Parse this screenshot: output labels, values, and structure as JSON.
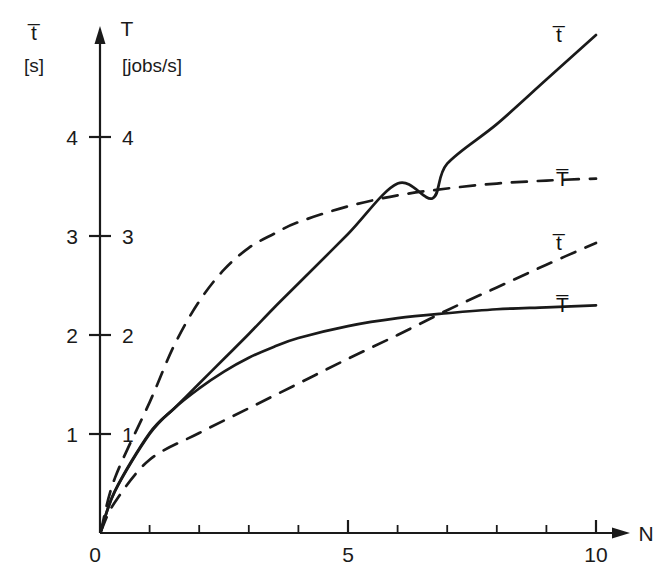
{
  "figure": {
    "background_color": "#ffffff",
    "ink_color": "#1a1a1a"
  },
  "axes": {
    "y_left": {
      "variable": "t̅",
      "unit": "[s]",
      "ticks": [
        "1",
        "2",
        "3",
        "4"
      ]
    },
    "y_right": {
      "variable": "T",
      "unit": "[jobs/s]",
      "ticks": [
        "1",
        "2",
        "3",
        "4"
      ]
    },
    "x": {
      "variable": "N",
      "origin_label": "0",
      "ticks": [
        "5",
        "10"
      ]
    }
  },
  "curve_labels": {
    "t_solid": "t̅",
    "T_dashed": "T̅",
    "t_dashed": "t̅",
    "T_solid": "T̅"
  },
  "chart_data": {
    "type": "line",
    "title": "",
    "xlabel": "N",
    "ylabel": "t̅ [s] / T [jobs/s]",
    "xlim": [
      0,
      11
    ],
    "ylim": [
      0,
      5.2
    ],
    "xticks": [
      0,
      5,
      10
    ],
    "xtick_labels": [
      "0",
      "5",
      "10"
    ],
    "xminor_ticks": [
      1,
      2,
      3,
      4,
      6,
      7,
      8,
      9
    ],
    "yticks": [
      1,
      2,
      3,
      4
    ],
    "ytick_labels": [
      "1",
      "2",
      "3",
      "4"
    ],
    "grid": false,
    "legend": "right-of-curve-ends",
    "series": [
      {
        "name": "t̅",
        "label": "t̅",
        "style": "solid",
        "note": "response time, heavily loaded system - grows linearly with N",
        "x": [
          1.0,
          1.5,
          2.0,
          2.5,
          3.0,
          3.5,
          4.0,
          5.0,
          6.0,
          6.7,
          7.0,
          8.0,
          9.0,
          10.0
        ],
        "y": [
          1.01,
          1.26,
          1.51,
          1.76,
          2.01,
          2.27,
          2.52,
          3.02,
          3.53,
          3.38,
          3.73,
          4.13,
          4.58,
          5.03
        ]
      },
      {
        "name": "T̅",
        "label": "T̅",
        "style": "dashed",
        "note": "throughput, fast system - saturates quickly toward ~3.6 jobs/s",
        "x": [
          1.0,
          1.5,
          2.0,
          2.5,
          3.0,
          3.5,
          4.0,
          5.0,
          6.0,
          7.0,
          8.0,
          9.0,
          10.0
        ],
        "y": [
          1.32,
          1.9,
          2.34,
          2.66,
          2.88,
          3.02,
          3.14,
          3.3,
          3.41,
          3.48,
          3.53,
          3.56,
          3.58
        ]
      },
      {
        "name": "t̅",
        "label": "t̅",
        "style": "dashed",
        "note": "response time, fast system - slow near-linear growth",
        "x": [
          1.0,
          2.0,
          3.0,
          4.0,
          5.0,
          6.0,
          7.0,
          8.0,
          9.0,
          10.0
        ],
        "y": [
          0.74,
          1.01,
          1.26,
          1.51,
          1.76,
          2.0,
          2.25,
          2.48,
          2.71,
          2.93
        ]
      },
      {
        "name": "T̅",
        "label": "T̅",
        "style": "solid",
        "note": "throughput, heavily loaded system - saturates toward ~2.3 jobs/s",
        "x": [
          1.0,
          1.5,
          2.0,
          2.5,
          3.0,
          3.5,
          4.0,
          5.0,
          6.0,
          7.0,
          8.0,
          9.0,
          10.0
        ],
        "y": [
          1.0,
          1.26,
          1.46,
          1.63,
          1.77,
          1.88,
          1.97,
          2.09,
          2.17,
          2.22,
          2.26,
          2.28,
          2.3
        ]
      }
    ],
    "intersections": [
      {
        "x": 6.7,
        "y": 3.38,
        "between": [
          "t̅ solid",
          "T̅ dashed"
        ]
      },
      {
        "x": 6.9,
        "y": 2.22,
        "between": [
          "t̅ dashed",
          "T̅ solid"
        ]
      },
      {
        "x": 3.05,
        "y": 1.78,
        "between": [
          "t̅ solid",
          "T̅ solid"
        ]
      }
    ]
  }
}
